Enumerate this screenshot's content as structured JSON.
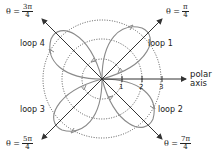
{
  "diagram": {
    "title": "",
    "colors": {
      "loops": "#8a8a8a",
      "axes": "#333333",
      "circles": "#555555",
      "text": "#222222"
    },
    "center": [
      102,
      79
    ],
    "circle_radii": [
      20,
      40,
      60
    ],
    "angle_labels": [
      {
        "id": "theta-pi-4",
        "prefix": "θ =",
        "num": "π",
        "den": "4"
      },
      {
        "id": "theta-3pi-4",
        "prefix": "θ =",
        "num": "3π",
        "den": "4"
      },
      {
        "id": "theta-5pi-4",
        "prefix": "θ =",
        "num": "5π",
        "den": "4"
      },
      {
        "id": "theta-7pi-4",
        "prefix": "θ =",
        "num": "7π",
        "den": "4"
      }
    ],
    "loops": [
      {
        "label": "loop 1"
      },
      {
        "label": "loop 2"
      },
      {
        "label": "loop 3"
      },
      {
        "label": "loop 4"
      }
    ],
    "ticks": [
      "1",
      "2",
      "3"
    ],
    "polar_axis": {
      "line1": "polar",
      "line2": "axis"
    }
  }
}
